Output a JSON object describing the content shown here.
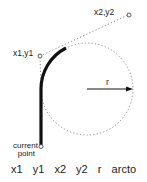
{
  "diagram": {
    "labels": {
      "p2": "x2,y2",
      "p1": "x1,y1",
      "radius": "r",
      "current_point_line1": "current",
      "current_point_line2": "point"
    },
    "caption": "x1  y1  x2  y2  r  arcto",
    "geometry": {
      "circle_center": [
        87,
        89
      ],
      "radius": 46,
      "current_point": [
        41,
        146
      ],
      "p1": [
        40,
        56
      ],
      "p2": [
        128,
        15
      ],
      "tangent_point_1": [
        41,
        89
      ],
      "tangent_point_2": [
        66,
        47
      ]
    },
    "colors": {
      "stroke": "#111111",
      "dotted": "#777777",
      "text": "#222222"
    }
  }
}
